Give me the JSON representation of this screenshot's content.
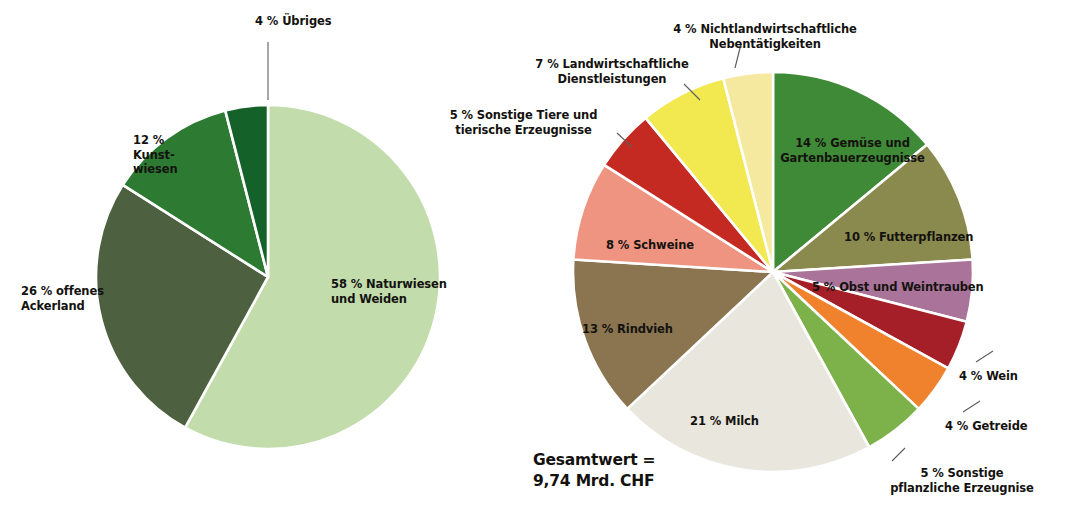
{
  "chart_data": [
    {
      "type": "pie",
      "name": "landwirtschaftliche-nutzflaeche",
      "title": "",
      "start_angle_deg": 0,
      "direction": "clockwise",
      "center": {
        "x": 268,
        "y": 277
      },
      "radius": 172,
      "unit": "%",
      "categories": [
        "Naturwiesen und Weiden",
        "offenes Ackerland",
        "Kunstwiesen",
        "Übriges"
      ],
      "values": [
        58,
        26,
        12,
        4
      ],
      "colors": [
        "#c2dcac",
        "#4d6141",
        "#2d7a33",
        "#15612a"
      ],
      "slices": [
        {
          "percent_label": "58 %",
          "name": "Naturwiesen\nund Weiden",
          "label": "58 % Naturwiesen\nund Weiden",
          "value": 58,
          "color": "#c2dcac",
          "label_placement": "inside"
        },
        {
          "percent_label": "26 %",
          "name": "offenes\nAckerland",
          "label": "26 % offenes\nAckerland",
          "value": 26,
          "color": "#4d6141",
          "label_placement": "inside"
        },
        {
          "percent_label": "12 %",
          "name": "Kunst-\nwiesen",
          "label": "12 %\nKunst-\nwiesen",
          "value": 12,
          "color": "#2d7a33",
          "label_placement": "inside"
        },
        {
          "percent_label": "4 %",
          "name": "Übriges",
          "label": "4 % Übriges",
          "value": 4,
          "color": "#15612a",
          "label_placement": "outside-leader"
        }
      ]
    },
    {
      "type": "pie",
      "name": "produktionswert-landwirtschaft",
      "title": "",
      "start_angle_deg": 0,
      "direction": "clockwise",
      "center": {
        "x": 773,
        "y": 272
      },
      "radius": 200,
      "unit": "%",
      "total_label": "Gesamtwert =\n9,74 Mrd. CHF",
      "total_value": "9,74 Mrd. CHF",
      "categories": [
        "Gemüse und Gartenbauerzeugnisse",
        "Futterpflanzen",
        "Obst und Weintrauben",
        "Wein",
        "Getreide",
        "Sonstige pflanzliche Erzeugnisse",
        "Milch",
        "Rindvieh",
        "Schweine",
        "Sonstige Tiere und tierische Erzeugnisse",
        "Landwirtschaftliche Dienstleistungen",
        "Nichtlandwirtschaftliche Nebentätigkeiten"
      ],
      "values": [
        14,
        10,
        5,
        4,
        4,
        5,
        21,
        13,
        8,
        5,
        7,
        4
      ],
      "colors": [
        "#3f8a37",
        "#8a8a4f",
        "#a9739a",
        "#a51f28",
        "#f0822d",
        "#7db14a",
        "#e8e6dd",
        "#8a7550",
        "#ef9480",
        "#c42a22",
        "#f2e850",
        "#f5e9a0"
      ],
      "slices": [
        {
          "percent_label": "14 %",
          "name": "Gemüse und\nGartenbauerzeugnisse",
          "label": "14 % Gemüse und\nGartenbauerzeugnisse",
          "value": 14,
          "color": "#3f8a37",
          "label_placement": "inside"
        },
        {
          "percent_label": "10 %",
          "name": "Futterpflanzen",
          "label": "10 % Futterpflanzen",
          "value": 10,
          "color": "#8a8a4f",
          "label_placement": "inside"
        },
        {
          "percent_label": "5 %",
          "name": "Obst und Weintrauben",
          "label": "5 % Obst und Weintrauben",
          "value": 5,
          "color": "#a9739a",
          "label_placement": "inside"
        },
        {
          "percent_label": "4 %",
          "name": "Wein",
          "label": "4 % Wein",
          "value": 4,
          "color": "#a51f28",
          "label_placement": "outside-leader"
        },
        {
          "percent_label": "4 %",
          "name": "Getreide",
          "label": "4 % Getreide",
          "value": 4,
          "color": "#f0822d",
          "label_placement": "outside-leader"
        },
        {
          "percent_label": "5 %",
          "name": "Sonstige\npflanzliche Erzeugnise",
          "label": "5 % Sonstige\npflanzliche Erzeugnise",
          "value": 5,
          "color": "#7db14a",
          "label_placement": "outside-leader"
        },
        {
          "percent_label": "21 %",
          "name": "Milch",
          "label": "21 % Milch",
          "value": 21,
          "color": "#e8e6dd",
          "label_placement": "inside"
        },
        {
          "percent_label": "13 %",
          "name": "Rindvieh",
          "label": "13 % Rindvieh",
          "value": 13,
          "color": "#8a7550",
          "label_placement": "inside"
        },
        {
          "percent_label": "8 %",
          "name": "Schweine",
          "label": "8 % Schweine",
          "value": 8,
          "color": "#ef9480",
          "label_placement": "inside"
        },
        {
          "percent_label": "5 %",
          "name": "Sonstige Tiere und\ntierische Erzeugnisse",
          "label": "5 % Sonstige Tiere und\ntierische Erzeugnisse",
          "value": 5,
          "color": "#c42a22",
          "label_placement": "outside-leader"
        },
        {
          "percent_label": "7 %",
          "name": "Landwirtschaftliche\nDienstleistungen",
          "label": "7 % Landwirtschaftliche\nDienstleistungen",
          "value": 7,
          "color": "#f2e850",
          "label_placement": "outside-leader"
        },
        {
          "percent_label": "4 %",
          "name": "Nichtlandwirtschaftliche\nNebentätigkeiten",
          "label": "4 % Nichtlandwirtschaftliche\nNebentätigkeiten",
          "value": 4,
          "color": "#f5e9a0",
          "label_placement": "outside-leader"
        }
      ]
    }
  ],
  "left_chart": {
    "labels": {
      "uebriges": "4 % Übriges",
      "kunstwiesen": "12 %\nKunst-\nwiesen",
      "ackerland": "26 % offenes\nAckerland",
      "naturwiesen": "58 % Naturwiesen\nund Weiden"
    }
  },
  "right_chart": {
    "labels": {
      "nichtlandwirtschaftliche": "4 % Nichtlandwirtschaftliche\nNebentätigkeiten",
      "dienstleistungen": "7 % Landwirtschaftliche\nDienstleistungen",
      "sonstige_tiere": "5 % Sonstige Tiere und\ntierische Erzeugnisse",
      "gemuese": "14 % Gemüse und\nGartenbauerzeugnisse",
      "futterpflanzen": "10 % Futterpflanzen",
      "obst": "5 % Obst und Weintrauben",
      "wein": "4 % Wein",
      "getreide": "4 % Getreide",
      "sonstige_pflanzliche": "5 % Sonstige\npflanzliche Erzeugnise",
      "schweine": "8 % Schweine",
      "rindvieh": "13 % Rindvieh",
      "milch": "21 % Milch"
    },
    "total": "Gesamtwert =\n9,74 Mrd. CHF"
  },
  "theme": {
    "background": "#ffffff",
    "text_color": "#14120f",
    "leader_color": "#5d5d5d",
    "slice_gap_color": "#ffffff"
  }
}
